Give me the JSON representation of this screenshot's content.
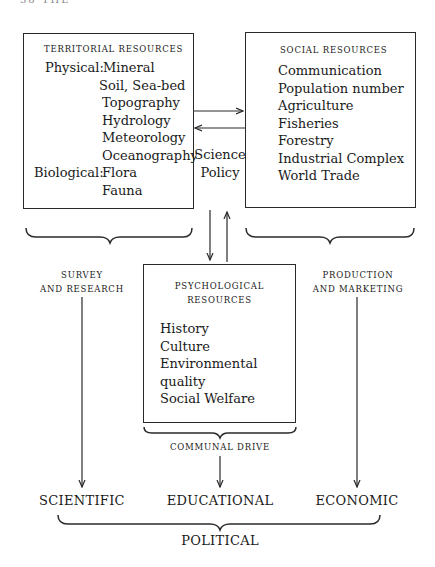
{
  "page_header": "38 THE",
  "territorial": {
    "title": "Territorial Resources",
    "physical_label": "Physical:",
    "physical_items": [
      "Mineral",
      "Soil, Sea-bed",
      "Topography",
      "Hydrology",
      "Meteorology",
      "Oceanography"
    ],
    "biological_label": "Biological:",
    "biological_items": [
      "Flora",
      "Fauna"
    ]
  },
  "social": {
    "title": "Social Resources",
    "items": [
      "Communication",
      "Population number",
      "Agriculture",
      "Fisheries",
      "Forestry",
      "Industrial Complex",
      "World Trade"
    ]
  },
  "science_policy": {
    "line1": "Science",
    "line2": "Policy"
  },
  "psychological": {
    "title_line1": "Psychological",
    "title_line2": "Resources",
    "items": [
      "History",
      "Culture",
      "Environmental",
      "quality",
      "Social Welfare"
    ]
  },
  "drives": {
    "survey_line1": "Survey",
    "survey_line2": "and Research",
    "production_line1": "Production",
    "production_line2": "and Marketing",
    "communal": "Communal Drive"
  },
  "outcomes": {
    "scientific": "Scientific",
    "educational": "Educational",
    "economic": "Economic",
    "political": "Political"
  },
  "colors": {
    "ink": "#1a1a1a",
    "line": "#2a2a2a",
    "background": "#ffffff"
  }
}
